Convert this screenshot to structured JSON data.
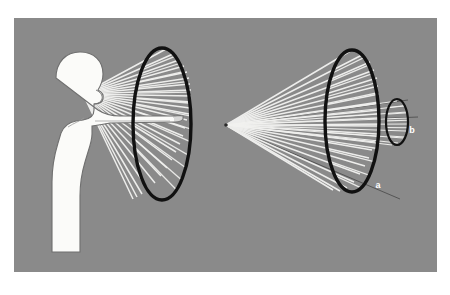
{
  "figure": {
    "canvas": {
      "width": 450,
      "height": 295
    },
    "background_color": "#ffffff",
    "plate_color": "#8a8a8a",
    "plate": {
      "x": 14,
      "y": 18,
      "width": 423,
      "height": 254
    },
    "ray_color": "#f2f2f0",
    "outline_color": "#111111",
    "thin_line_color": "#3c3c3c",
    "figure_fill": "#fbfbf9",
    "figure_outline": "#6f6f6f",
    "panels": [
      {
        "id": "left-panel",
        "name": "observer-with-visual-cone",
        "description": "Human silhouette in profile with outstretched arm, rays from the eye spreading to a large ellipse",
        "apex": {
          "x": 83,
          "y": 94
        },
        "ellipse": {
          "cx": 162,
          "cy": 124,
          "rx": 29,
          "ry": 76
        },
        "ray_count": 26
      },
      {
        "id": "right-panel",
        "name": "projection-cone-with-two-sections",
        "description": "Cone of rays from a vertex point expanding to a large ellipse section and a small ellipse section",
        "apex": {
          "x": 226,
          "y": 125
        },
        "large_ellipse": {
          "cx": 352,
          "cy": 121,
          "rx": 27,
          "ry": 71,
          "label": "a"
        },
        "small_ellipse": {
          "cx": 397,
          "cy": 122,
          "rx": 11,
          "ry": 23,
          "label": "b"
        },
        "ray_count": 26
      }
    ],
    "labels": [
      {
        "id": "label-a",
        "text": "a",
        "x": 378,
        "y": 188,
        "panel": "right-panel",
        "refers_to": "large-ellipse-section"
      },
      {
        "id": "label-b",
        "text": "b",
        "x": 412,
        "y": 133,
        "panel": "right-panel",
        "refers_to": "small-ellipse-section"
      }
    ]
  }
}
